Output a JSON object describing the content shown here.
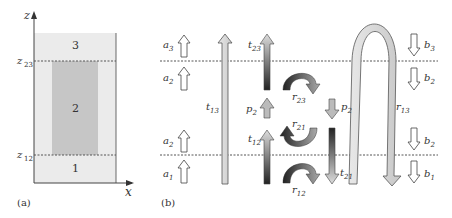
{
  "panel_a": {
    "caption": "(a)",
    "axis_z": "z",
    "axis_x": "x",
    "z23": "z",
    "z23_sub": "23",
    "z12": "z",
    "z12_sub": "12",
    "regions": [
      "1",
      "2",
      "3"
    ]
  },
  "panel_b": {
    "caption": "(b)",
    "labels": {
      "a3": "a",
      "a3_sub": "3",
      "a2p": "a",
      "a2p_sub": "2",
      "a2": "a",
      "a2_sub": "2",
      "a1p": "a",
      "a1p_sub": "1",
      "t13": "t",
      "t13_sub": "13",
      "t23": "t",
      "t23_sub": "23",
      "t12": "t",
      "t12_sub": "12",
      "t21": "t",
      "t21_sub": "21",
      "p2plus": "p",
      "p2plus_sub": "2",
      "p2minus": "p",
      "p2minus_sub": "2",
      "r23": "r",
      "r23_sub": "23",
      "r21": "r",
      "r21_sub": "21",
      "r12": "r",
      "r12_sub": "12",
      "r13": "r",
      "r13_sub": "13",
      "b3p": "b",
      "b3p_sub": "3",
      "b2": "b",
      "b2_sub": "2",
      "b2p": "b",
      "b2p_sub": "2",
      "b1": "b",
      "b1_sub": "1"
    }
  },
  "colors": {
    "light_region": "#ebebeb",
    "dark_region": "#c6c6c6",
    "line": "#555555"
  }
}
